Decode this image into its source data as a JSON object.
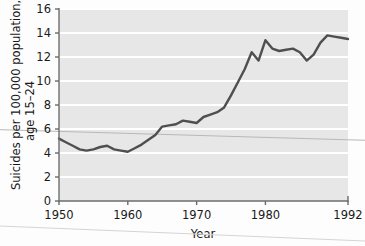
{
  "chart_data": {
    "type": "line",
    "title": "",
    "subtitle": "",
    "xlabel": "Year",
    "ylabel": "Suicides per 100,000 population, age 15–24",
    "ylabel_line1": "Suicides per 100,000 population,",
    "ylabel_line2": "age 15–24",
    "xlim": [
      1950,
      1992
    ],
    "ylim": [
      0,
      16
    ],
    "xticks": [
      1950,
      1960,
      1970,
      1980,
      1992
    ],
    "xtick_labels": [
      "1950",
      "1960",
      "1970",
      "1980",
      "1992"
    ],
    "yticks": [
      0,
      2,
      4,
      6,
      8,
      10,
      12,
      14,
      16
    ],
    "ytick_labels": [
      "0",
      "2",
      "4",
      "6",
      "8",
      "10",
      "12",
      "14",
      "16"
    ],
    "grid": "horizontal-white-on-gray",
    "legend": "none",
    "plot_bgcolor": "#e7e7e7",
    "gridline_color": "#ffffff",
    "line_color": "#4f4f4f",
    "axis_color": "#6a6a6a",
    "series": [
      {
        "name": "Suicide rate, ages 15–24",
        "x": [
          1950,
          1951,
          1952,
          1953,
          1954,
          1955,
          1956,
          1957,
          1958,
          1959,
          1960,
          1961,
          1962,
          1963,
          1964,
          1965,
          1966,
          1967,
          1968,
          1969,
          1970,
          1971,
          1972,
          1973,
          1974,
          1975,
          1976,
          1977,
          1978,
          1979,
          1980,
          1981,
          1982,
          1983,
          1984,
          1985,
          1986,
          1987,
          1988,
          1989,
          1990,
          1991,
          1992
        ],
        "values": [
          5.2,
          4.9,
          4.6,
          4.3,
          4.2,
          4.3,
          4.5,
          4.6,
          4.3,
          4.2,
          4.1,
          4.4,
          4.7,
          5.1,
          5.5,
          6.2,
          6.3,
          6.4,
          6.7,
          6.6,
          6.5,
          7.0,
          7.2,
          7.4,
          7.8,
          8.8,
          9.9,
          11.0,
          12.4,
          11.7,
          13.4,
          12.7,
          12.5,
          12.6,
          12.7,
          12.4,
          11.7,
          12.2,
          13.2,
          13.8,
          13.7,
          13.6,
          13.5
        ]
      }
    ],
    "annotations": [
      {
        "name": "scan-artifact-line-upper",
        "description": "faint thin gray line crossing plot",
        "x_start": 1950,
        "y_start": 5.8,
        "x_end": 1992,
        "y_end": 5.1,
        "color": "#b9b9b9"
      },
      {
        "name": "scan-artifact-line-lower",
        "description": "faint thin gray line crossing bottom margin",
        "color": "#cfcfcf"
      }
    ]
  },
  "axes": {
    "x_title": "Year",
    "y_title_line1": "Suicides per 100,000 population,",
    "y_title_line2": "age 15–24"
  }
}
